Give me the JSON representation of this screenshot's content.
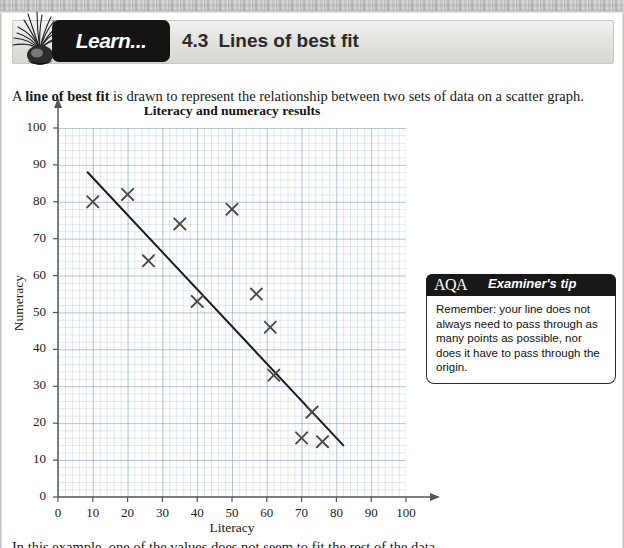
{
  "header": {
    "tab_label": "Learn...",
    "section_number": "4.3",
    "section_title": "Lines of best fit",
    "plant_icon": "spider-plant-icon"
  },
  "intro": {
    "text_before": "A ",
    "bold_term": "line of best fit",
    "text_after": " is drawn to represent the relationship between two sets of data on a scatter graph."
  },
  "examiner_tip": {
    "logo": "AQA",
    "title": "Examiner's tip",
    "body": "Remember: your line does not always need to pass through as many points as possible, nor does it have to pass through the origin."
  },
  "bottom_note": {
    "text": "In this example, one of the values does not seem to fit the rest of the data."
  },
  "chart_data": {
    "type": "scatter",
    "title": "Literacy and numeracy results",
    "xlabel": "Literacy",
    "ylabel": "Numeracy",
    "xlim": [
      0,
      100
    ],
    "ylim": [
      0,
      100
    ],
    "xticks": [
      0,
      10,
      20,
      30,
      40,
      50,
      60,
      70,
      80,
      90,
      100
    ],
    "yticks": [
      0,
      10,
      20,
      30,
      40,
      50,
      60,
      70,
      80,
      90,
      100
    ],
    "grid": true,
    "grid_minor_step": 2,
    "grid_major_step": 10,
    "legend": null,
    "marker": "x",
    "marker_color": "#4a4a4a",
    "points": [
      {
        "x": 10,
        "y": 80
      },
      {
        "x": 20,
        "y": 82
      },
      {
        "x": 26,
        "y": 64
      },
      {
        "x": 35,
        "y": 74
      },
      {
        "x": 40,
        "y": 53
      },
      {
        "x": 50,
        "y": 78
      },
      {
        "x": 57,
        "y": 55
      },
      {
        "x": 61,
        "y": 46
      },
      {
        "x": 62,
        "y": 33
      },
      {
        "x": 70,
        "y": 16
      },
      {
        "x": 73,
        "y": 23
      },
      {
        "x": 76,
        "y": 15
      }
    ],
    "trendline": {
      "name": "line of best fit",
      "x1": 8.5,
      "y1": 88,
      "x2": 82,
      "y2": 14,
      "color": "#1c1c1c"
    }
  },
  "colors": {
    "banner_dark": "#141414",
    "grid_blue": "#96aac8",
    "axis": "#555555",
    "page_background": "#ffffff"
  }
}
